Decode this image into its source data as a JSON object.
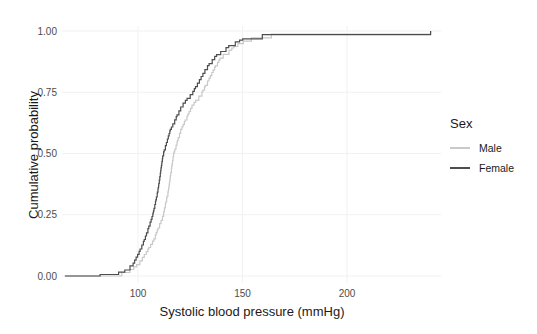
{
  "chart_data": {
    "type": "line",
    "variant": "ecdf-step",
    "title": "",
    "xlabel": "Systolic blood pressure (mmHg)",
    "ylabel": "Cumulative probability",
    "xlim": [
      62,
      245
    ],
    "ylim": [
      0,
      1
    ],
    "grid": "major-only, very light, no axis lines",
    "x_ticks": [
      100,
      150,
      200
    ],
    "x_tick_labels": [
      "100",
      "150",
      "200"
    ],
    "y_ticks": [
      0,
      0.25,
      0.5,
      0.75,
      1
    ],
    "y_tick_labels": [
      "0.00",
      "0.25",
      "0.50",
      "0.75",
      "1.00"
    ],
    "colors": {
      "male_line": "#c9c9c9",
      "female_line": "#4d4d4d",
      "tick_text": "#4d4d4d",
      "title_text": "#1a1a1a",
      "gridline": "#f1f1f1",
      "background": "#ffffff"
    },
    "legend": {
      "title": "Sex",
      "position": "right"
    },
    "series": [
      {
        "name": "Male",
        "color": "#c9c9c9",
        "min_value": 65,
        "max_value": 240,
        "quantiles": [
          [
            0,
            65
          ],
          [
            0.004,
            80
          ],
          [
            0.01,
            90
          ],
          [
            0.02,
            95
          ],
          [
            0.05,
            100
          ],
          [
            0.1,
            104
          ],
          [
            0.15,
            107.5
          ],
          [
            0.25,
            112
          ],
          [
            0.35,
            114.5
          ],
          [
            0.5,
            117
          ],
          [
            0.6,
            120.5
          ],
          [
            0.7,
            126
          ],
          [
            0.75,
            130.5
          ],
          [
            0.85,
            136.5
          ],
          [
            0.9,
            140
          ],
          [
            0.95,
            148
          ],
          [
            0.975,
            155
          ],
          [
            0.99,
            166
          ],
          [
            0.997,
            180
          ],
          [
            1,
            240
          ]
        ]
      },
      {
        "name": "Female",
        "color": "#4d4d4d",
        "min_value": 65,
        "max_value": 240,
        "quantiles": [
          [
            0,
            65
          ],
          [
            0.004,
            79
          ],
          [
            0.01,
            88
          ],
          [
            0.02,
            93
          ],
          [
            0.05,
            97.5
          ],
          [
            0.1,
            100.5
          ],
          [
            0.15,
            103
          ],
          [
            0.25,
            107
          ],
          [
            0.35,
            109.5
          ],
          [
            0.5,
            112
          ],
          [
            0.6,
            115.5
          ],
          [
            0.7,
            121
          ],
          [
            0.75,
            126
          ],
          [
            0.85,
            132.5
          ],
          [
            0.9,
            137
          ],
          [
            0.95,
            145
          ],
          [
            0.975,
            152
          ],
          [
            0.99,
            163
          ],
          [
            0.997,
            177
          ],
          [
            1,
            240
          ]
        ]
      }
    ]
  }
}
